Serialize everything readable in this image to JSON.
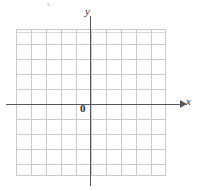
{
  "figure": {
    "name": "blank-cartesian-coordinate-grid",
    "width": 197,
    "height": 191,
    "background_color": "#ffffff"
  },
  "axes": {
    "x_label": "x",
    "y_label": "y",
    "origin_label": "0",
    "axis_color": "#575760",
    "x_arrow_direction": "right"
  },
  "grid": {
    "major_line_color": "#c9c9d2",
    "minor_line_color": "#b9b9c3",
    "major_cells_horizontal": 10,
    "major_cells_vertical": 10,
    "minor_divisions_per_major": 5,
    "style": "graph-paper"
  },
  "chart_data": {
    "type": "scatter",
    "title": "",
    "xlabel": "x",
    "ylabel": "y",
    "series": [],
    "x": [],
    "y": [],
    "xlim": [
      -5,
      5
    ],
    "ylim": [
      -5,
      5
    ],
    "xticks": [],
    "yticks": [],
    "grid": true,
    "legend": "none",
    "annotations": [
      "0"
    ]
  }
}
